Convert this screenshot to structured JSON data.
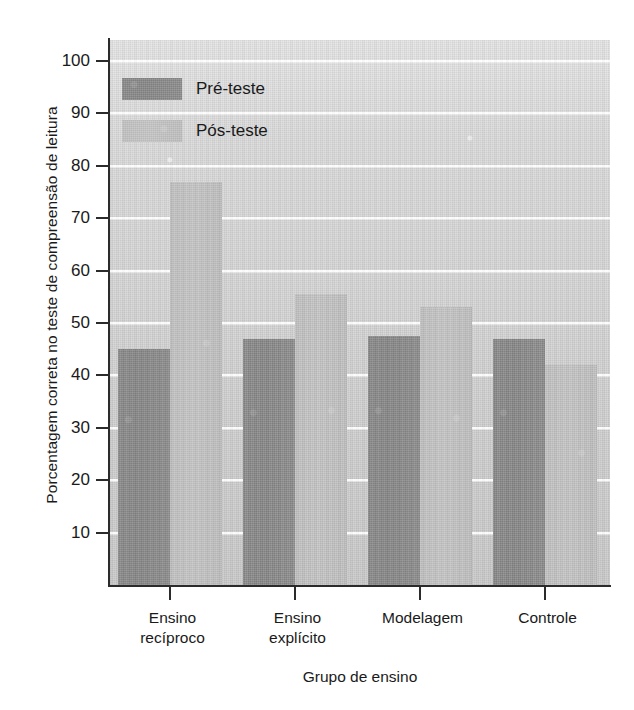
{
  "chart_data": {
    "type": "bar",
    "title": "",
    "xlabel": "Grupo de ensino",
    "ylabel": "Porcentagem correta no teste de compreensão de leitura",
    "categories": [
      "Ensino recíproco",
      "Ensino explícito",
      "Modelagem",
      "Controle"
    ],
    "categories_lines": [
      [
        "Ensino",
        "recíproco"
      ],
      [
        "Ensino",
        "explícito"
      ],
      [
        "Modelagem",
        ""
      ],
      [
        "Controle",
        ""
      ]
    ],
    "series": [
      {
        "name": "Pré-teste",
        "values": [
          45,
          47,
          47.5,
          47
        ],
        "color": "#8c8c8c"
      },
      {
        "name": "Pós-teste",
        "values": [
          77,
          55.5,
          53,
          42
        ],
        "color": "#c3c3c3"
      }
    ],
    "ylim": [
      0,
      104
    ],
    "yticks": [
      10,
      20,
      30,
      40,
      50,
      60,
      70,
      80,
      90,
      100
    ],
    "ytick_labels": [
      "10",
      "20",
      "30",
      "40",
      "50",
      "60",
      "70",
      "80",
      "90",
      "100"
    ],
    "grid": true,
    "grid_color": "#ffffff",
    "legend_position": "upper-left",
    "plot_background": "#d8d8d8"
  },
  "legend": {
    "items": [
      {
        "label": "Pré-teste",
        "swatch": "#8c8c8c"
      },
      {
        "label": "Pós-teste",
        "swatch": "#c3c3c3"
      }
    ]
  }
}
